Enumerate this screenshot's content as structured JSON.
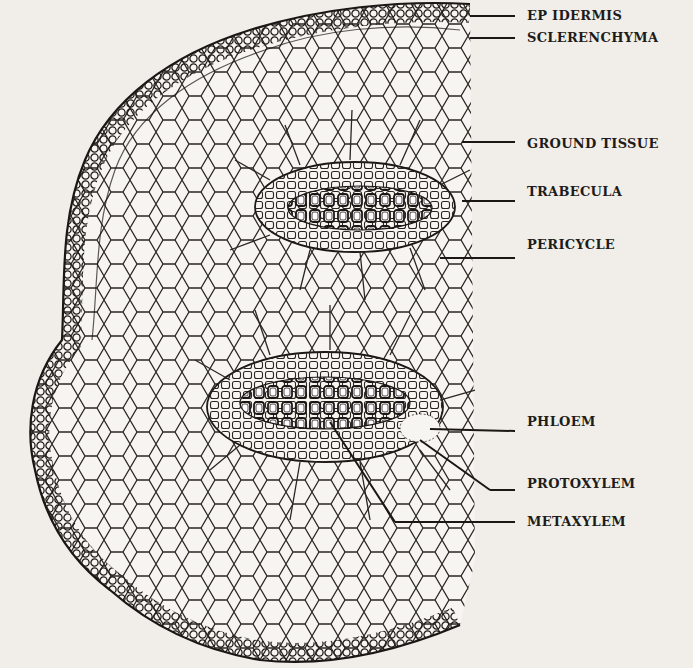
{
  "figure": {
    "labels": [
      {
        "id": "epidermis",
        "text": "EP IDERMIS",
        "x": 527,
        "y": 8
      },
      {
        "id": "sclerenchyma",
        "text": "SCLERENCHYMA",
        "x": 527,
        "y": 30
      },
      {
        "id": "ground-tissue",
        "text": "GROUND TISSUE",
        "x": 527,
        "y": 136
      },
      {
        "id": "trabecula",
        "text": "TRABECULA",
        "x": 527,
        "y": 184
      },
      {
        "id": "pericycle",
        "text": "PERICYCLE",
        "x": 527,
        "y": 237
      },
      {
        "id": "phloem",
        "text": "PHLOEM",
        "x": 527,
        "y": 414
      },
      {
        "id": "protoxylem",
        "text": "PROTOXYLEM",
        "x": 527,
        "y": 476
      },
      {
        "id": "metaxylem",
        "text": "METAXYLEM",
        "x": 527,
        "y": 514
      }
    ]
  }
}
